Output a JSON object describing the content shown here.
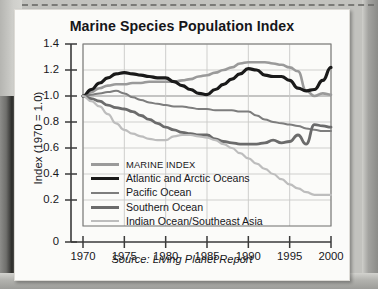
{
  "figure": {
    "title": "Marine Species Population Index",
    "source_note": "Source: Living Planet Report"
  },
  "colors": {
    "marine_index": "#9a9a9a",
    "atlantic": "#1a1a1a",
    "pacific": "#7d7d7d",
    "southern": "#6b6b6b",
    "indian": "#bdbdbd",
    "grid": "#c9c9c7",
    "axis": "#3a3a3a",
    "plot_bg": "#fbfbf9",
    "page_bg": "#fbfbf9"
  },
  "chart_data": {
    "type": "line",
    "title": "Marine Species Population Index",
    "xlabel": "",
    "ylabel": "Index (1970 = 1.0)",
    "xlim": [
      1970,
      2000
    ],
    "ylim": [
      0,
      1.4
    ],
    "grid": true,
    "legend_position": "inside-lower-left",
    "xticks": [
      1970,
      1975,
      1980,
      1985,
      1990,
      1995,
      2000
    ],
    "xtick_labels": [
      "1970",
      "1975",
      "1980",
      "1985",
      "1990",
      "1995",
      "2000"
    ],
    "yticks": [
      0,
      0.2,
      0.4,
      0.6,
      0.8,
      1.0,
      1.2,
      1.4
    ],
    "ytick_labels": [
      "0",
      "0.2",
      "0.4",
      "0.6",
      "0.8",
      "1.0",
      "1.2",
      "1.4"
    ],
    "x": [
      1970,
      1971,
      1972,
      1973,
      1974,
      1975,
      1976,
      1977,
      1978,
      1979,
      1980,
      1981,
      1982,
      1983,
      1984,
      1985,
      1986,
      1987,
      1988,
      1989,
      1990,
      1991,
      1992,
      1993,
      1994,
      1995,
      1996,
      1997,
      1998,
      1999,
      2000
    ],
    "series": [
      {
        "name": "MARINE INDEX",
        "color": "#9a9a9a",
        "width": 2.6,
        "values": [
          1.0,
          1.03,
          1.06,
          1.08,
          1.09,
          1.09,
          1.1,
          1.1,
          1.11,
          1.11,
          1.11,
          1.11,
          1.12,
          1.13,
          1.15,
          1.16,
          1.18,
          1.2,
          1.22,
          1.25,
          1.26,
          1.26,
          1.26,
          1.25,
          1.24,
          1.22,
          1.19,
          1.04,
          1.0,
          1.02,
          1.01
        ]
      },
      {
        "name": "Atlantic and Arctic Oceans",
        "color": "#1a1a1a",
        "width": 3.2,
        "values": [
          1.0,
          1.05,
          1.1,
          1.14,
          1.17,
          1.18,
          1.17,
          1.16,
          1.15,
          1.14,
          1.14,
          1.11,
          1.08,
          1.05,
          1.02,
          1.01,
          1.05,
          1.09,
          1.13,
          1.17,
          1.21,
          1.2,
          1.16,
          1.15,
          1.15,
          1.12,
          1.06,
          1.04,
          1.05,
          1.12,
          1.22
        ]
      },
      {
        "name": "Pacific Ocean",
        "color": "#7d7d7d",
        "width": 2.0,
        "values": [
          1.0,
          1.01,
          1.02,
          1.03,
          1.04,
          1.02,
          0.99,
          0.97,
          0.95,
          0.94,
          0.93,
          0.92,
          0.92,
          0.91,
          0.9,
          0.9,
          0.89,
          0.89,
          0.89,
          0.88,
          0.88,
          0.85,
          0.82,
          0.8,
          0.79,
          0.78,
          0.77,
          0.75,
          0.74,
          0.73,
          0.73
        ]
      },
      {
        "name": "Southern Ocean",
        "color": "#6b6b6b",
        "width": 2.8,
        "values": [
          1.0,
          0.98,
          0.96,
          0.93,
          0.91,
          0.9,
          0.88,
          0.85,
          0.82,
          0.79,
          0.76,
          0.74,
          0.72,
          0.71,
          0.7,
          0.7,
          0.67,
          0.65,
          0.64,
          0.63,
          0.63,
          0.63,
          0.64,
          0.66,
          0.64,
          0.65,
          0.7,
          0.63,
          0.78,
          0.77,
          0.76
        ]
      },
      {
        "name": "Indian Ocean/Southeast Asia",
        "color": "#bdbdbd",
        "width": 2.2,
        "values": [
          1.0,
          0.96,
          0.92,
          0.86,
          0.79,
          0.74,
          0.71,
          0.69,
          0.67,
          0.66,
          0.66,
          0.69,
          0.7,
          0.7,
          0.69,
          0.68,
          0.66,
          0.63,
          0.6,
          0.56,
          0.52,
          0.48,
          0.44,
          0.4,
          0.36,
          0.32,
          0.29,
          0.26,
          0.24,
          0.24,
          0.24
        ]
      }
    ]
  },
  "legend": [
    {
      "label": "MARINE INDEX",
      "color": "#9a9a9a",
      "thickness": 3
    },
    {
      "label": "Atlantic and Arctic Oceans",
      "color": "#1a1a1a",
      "thickness": 3.6
    },
    {
      "label": "Pacific Ocean",
      "color": "#7d7d7d",
      "thickness": 2.2
    },
    {
      "label": "Southern Ocean",
      "color": "#6b6b6b",
      "thickness": 3
    },
    {
      "label": "Indian Ocean/Southeast Asia",
      "color": "#bdbdbd",
      "thickness": 2.2
    }
  ]
}
